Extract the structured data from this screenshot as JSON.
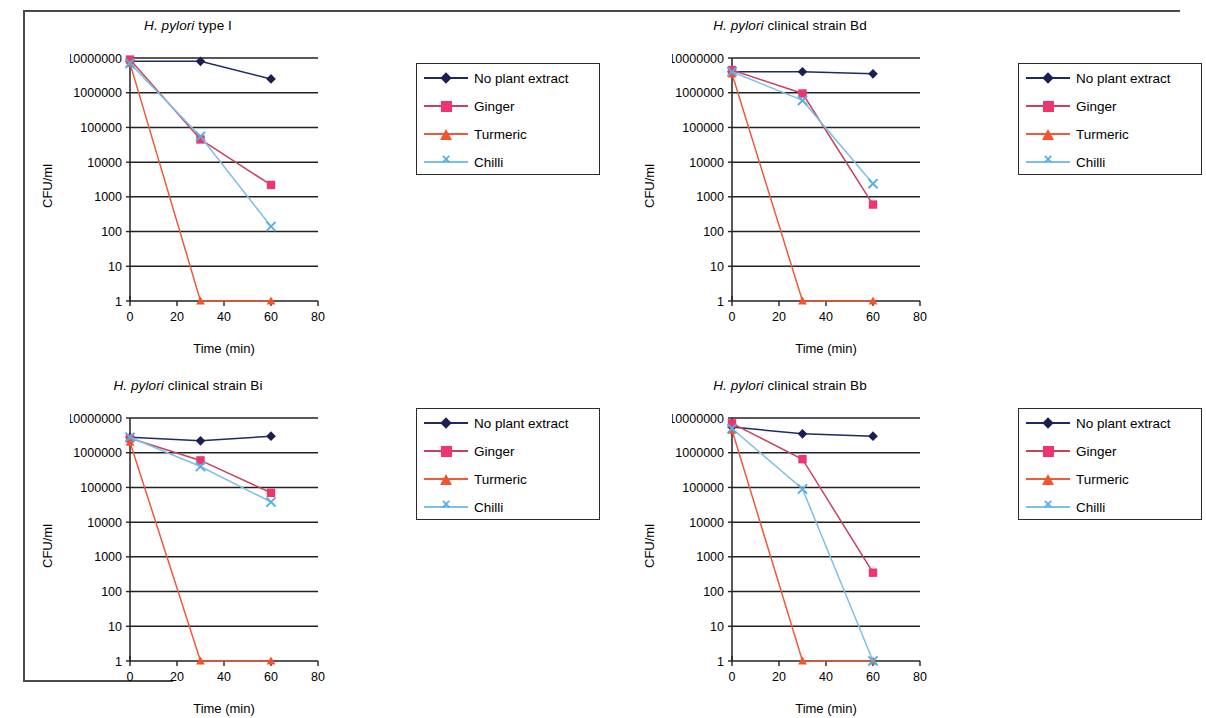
{
  "figure": {
    "axis_labels": {
      "y": "CFU/ml",
      "x": "Time (min)"
    },
    "y_ticks": [
      "10000000",
      "1000000",
      "100000",
      "10000",
      "1000",
      "100",
      "10",
      "1"
    ],
    "x_ticks": [
      "0",
      "20",
      "40",
      "60",
      "80"
    ],
    "series_colors": {
      "no_plant_extract_line": "#1f2a63",
      "no_plant_extract_marker": "#1a1f52",
      "ginger_line": "#c8415f",
      "ginger_marker": "#ee3570",
      "turmeric_line": "#ef5a3a",
      "turmeric_marker": "#f2542d",
      "chilli_line": "#7cc0e8",
      "chilli_marker": "#55aee2"
    },
    "legend": [
      {
        "label": "No plant extract",
        "marker": "diamond-marker"
      },
      {
        "label": "Ginger",
        "marker": "square-marker"
      },
      {
        "label": "Turmeric",
        "marker": "triangle-marker"
      },
      {
        "label": "Chilli",
        "marker": "cross-marker"
      }
    ]
  },
  "chart_data": [
    {
      "type": "line",
      "title_italic": "H. pylori",
      "title_rest": " type I",
      "title": "H. pylori type I",
      "xlabel": "Time (min)",
      "ylabel": "CFU/ml",
      "xlim": [
        0,
        80
      ],
      "ylim": [
        1,
        10000000
      ],
      "yscale": "log",
      "grid": true,
      "legend_position": "right",
      "x": [
        0,
        30,
        60
      ],
      "series": [
        {
          "name": "No plant extract",
          "values": [
            8000000,
            8000000,
            2500000
          ]
        },
        {
          "name": "Ginger",
          "values": [
            9000000,
            45000,
            2200
          ]
        },
        {
          "name": "Turmeric",
          "values": [
            7000000,
            1,
            1
          ]
        },
        {
          "name": "Chilli",
          "values": [
            7000000,
            55000,
            140
          ]
        }
      ]
    },
    {
      "type": "line",
      "title_italic": "H. pylori",
      "title_rest": " clinical strain Bd",
      "title": "H. pylori clinical strain Bd",
      "xlabel": "Time (min)",
      "ylabel": "CFU/ml",
      "xlim": [
        0,
        80
      ],
      "ylim": [
        1,
        10000000
      ],
      "yscale": "log",
      "grid": true,
      "legend_position": "right",
      "x": [
        0,
        30,
        60
      ],
      "series": [
        {
          "name": "No plant extract",
          "values": [
            4000000,
            4000000,
            3500000
          ]
        },
        {
          "name": "Ginger",
          "values": [
            4500000,
            950000,
            600
          ]
        },
        {
          "name": "Turmeric",
          "values": [
            3500000,
            1,
            1
          ]
        },
        {
          "name": "Chilli",
          "values": [
            4000000,
            600000,
            2400
          ]
        }
      ]
    },
    {
      "type": "line",
      "title_italic": "H. pylori",
      "title_rest": " clinical strain Bi",
      "title": "H. pylori clinical strain Bi",
      "xlabel": "Time (min)",
      "ylabel": "CFU/ml",
      "xlim": [
        0,
        80
      ],
      "ylim": [
        1,
        10000000
      ],
      "yscale": "log",
      "grid": true,
      "legend_position": "right",
      "x": [
        0,
        30,
        60
      ],
      "series": [
        {
          "name": "No plant extract",
          "values": [
            2800000,
            2200000,
            3000000
          ]
        },
        {
          "name": "Ginger",
          "values": [
            2600000,
            600000,
            70000
          ]
        },
        {
          "name": "Turmeric",
          "values": [
            2000000,
            1,
            1
          ]
        },
        {
          "name": "Chilli",
          "values": [
            2800000,
            400000,
            38000
          ]
        }
      ]
    },
    {
      "type": "line",
      "title_italic": "H. pylori",
      "title_rest": " clinical strain Bb",
      "title": "H. pylori clinical strain Bb",
      "xlabel": "Time (min)",
      "ylabel": "CFU/ml",
      "xlim": [
        0,
        80
      ],
      "ylim": [
        1,
        10000000
      ],
      "yscale": "log",
      "grid": true,
      "legend_position": "right",
      "x": [
        0,
        30,
        60
      ],
      "series": [
        {
          "name": "No plant extract",
          "values": [
            5500000,
            3500000,
            3000000
          ]
        },
        {
          "name": "Ginger",
          "values": [
            7000000,
            650000,
            350
          ]
        },
        {
          "name": "Turmeric",
          "values": [
            4500000,
            1,
            1
          ]
        },
        {
          "name": "Chilli",
          "values": [
            5000000,
            90000,
            1
          ]
        }
      ]
    }
  ]
}
